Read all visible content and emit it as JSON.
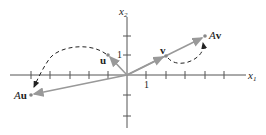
{
  "diagram": {
    "axes": {
      "x_label": "x",
      "x_sub": "1",
      "y_label": "x",
      "y_sub": "2",
      "tick_label_x": "1",
      "tick_label_y": "1"
    },
    "vectors": [
      {
        "name": "u",
        "label": "u",
        "coords": [
          -1,
          1
        ]
      },
      {
        "name": "Au",
        "label_prefix": "A",
        "label": "u",
        "coords": [
          -5,
          -1
        ]
      },
      {
        "name": "v",
        "label": "v",
        "coords": [
          2,
          1
        ]
      },
      {
        "name": "Av",
        "label_prefix": "A",
        "label": "v",
        "coords": [
          4,
          2
        ]
      }
    ],
    "colors": {
      "axis": "#444444",
      "vector": "#999999",
      "point": "#888888",
      "dashed": "#222222"
    }
  }
}
